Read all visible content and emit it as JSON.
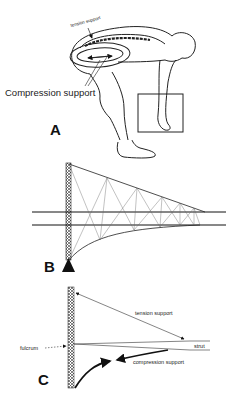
{
  "panels": {
    "a": {
      "letter": "A",
      "tension_label": "tension support",
      "compression_label": "Compression support"
    },
    "b": {
      "letter": "B"
    },
    "c": {
      "letter": "C",
      "tension_label": "tension support",
      "compression_label": "compression support",
      "fulcrum_label": "fulcrum",
      "strut_label": "strut"
    }
  },
  "colors": {
    "ink": "#111111",
    "light_ink": "#555555",
    "background": "#ffffff"
  }
}
